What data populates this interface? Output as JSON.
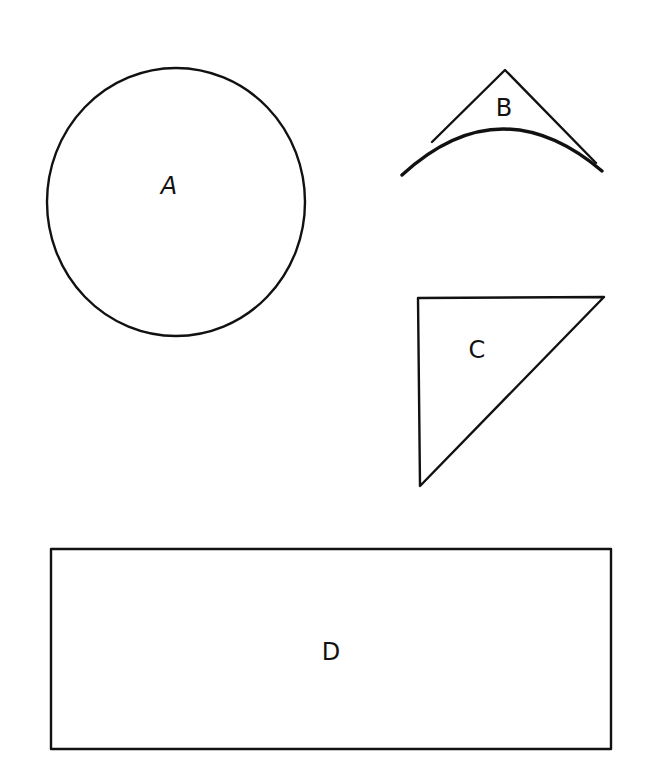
{
  "diagram": {
    "background": "#ffffff",
    "stroke_color": "#111111",
    "shapes": [
      {
        "id": "A",
        "type": "circle",
        "label": "A",
        "center": [
          176,
          202
        ],
        "radius_x": 129,
        "radius_y": 134
      },
      {
        "id": "B",
        "type": "curved-triangle",
        "label": "B",
        "apex": [
          505,
          70
        ],
        "arc_start": [
          402,
          175
        ],
        "arc_end": [
          602,
          171
        ]
      },
      {
        "id": "C",
        "type": "right-triangle",
        "label": "C",
        "vertices": [
          [
            418,
            298
          ],
          [
            604,
            297
          ],
          [
            420,
            486
          ]
        ]
      },
      {
        "id": "D",
        "type": "rectangle",
        "label": "D",
        "x": 51,
        "y": 549,
        "width": 560,
        "height": 200
      }
    ],
    "labels": {
      "a": "A",
      "b": "B",
      "c": "C",
      "d": "D"
    }
  }
}
